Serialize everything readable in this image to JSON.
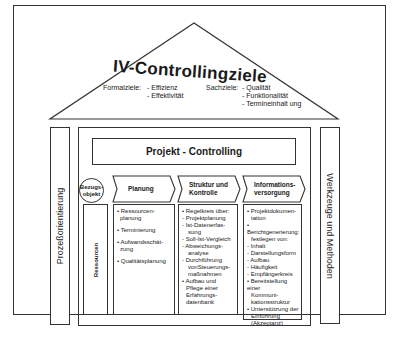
{
  "diagram": {
    "roof": {
      "title": "IV-Controllingziele",
      "formalziele": {
        "label": "Formalziele:",
        "items": [
          "- Effizienz",
          "- Effektivität"
        ]
      },
      "sachziele": {
        "label": "Sachziele:",
        "items": [
          "- Qualität",
          "- Funktionalität",
          "- Termineinhalt ung"
        ]
      }
    },
    "left_pillar": {
      "label": "Prozeßorientierung"
    },
    "right_pillar": {
      "label": "Werkzeuge und Methoden"
    },
    "center": {
      "header": "Projekt - Controlling",
      "bezugsobjekt": {
        "line1": "Bezugs-",
        "line2": "objekt"
      },
      "ressourcen": "Ressourcen",
      "columns": [
        {
          "title_line1": "Planung",
          "title_line2": "",
          "items": [
            "• Ressourcen-",
            "planung",
            "• Terminierung",
            "• Aufwandsschät-",
            "zung",
            "• Qualitätsplanung"
          ]
        },
        {
          "title_line1": "Struktur und",
          "title_line2": "Kontrolle",
          "items": [
            "• Regelkreis über:",
            "- Projektplanung",
            "- Ist-Datenerfas-",
            "sung",
            "- Soll-Ist-Vergleich",
            "- Abweichungs-",
            "analyse",
            "- Durchführung",
            "vonSteuerungs-",
            "maßnahmen",
            "• Aufbau und",
            "Pflege einer",
            "Erfahrungs-",
            "datenbank"
          ]
        },
        {
          "title_line1": "Informations-",
          "title_line2": "versorgung",
          "items": [
            "• Projektdokumen-",
            "tation",
            "• Berichtgenerierung:",
            "festlegen von:",
            "- Inhalt",
            "- Darstellungsform",
            "- Aufbau",
            "- Häufigkeit",
            "- Empfängerkreis",
            "• Bereitstellung einer",
            "Kommuni-",
            "kationsstruktur",
            "• Unterstützung der",
            "Einführung",
            "(Akzeptanz)"
          ]
        }
      ]
    }
  }
}
